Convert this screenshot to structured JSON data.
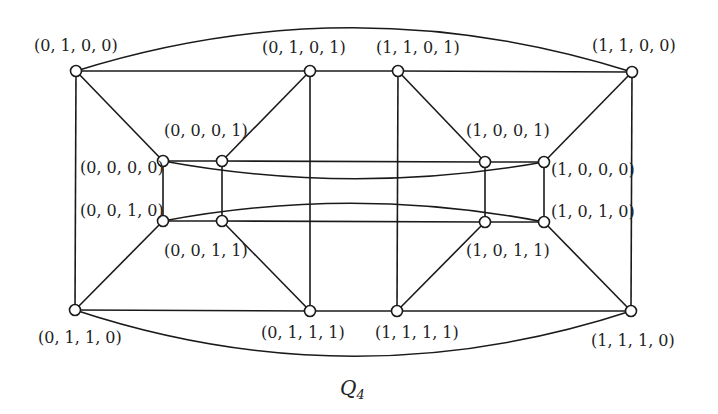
{
  "diagram": {
    "title": "Q",
    "title_subscript": "4",
    "colors": {
      "stroke": "#1a1a1a",
      "node_fill": "#ffffff",
      "text": "#222222",
      "background": "#ffffff"
    },
    "node_radius": 5.5,
    "nodes": [
      {
        "id": "0100",
        "label": "(0, 1, 0, 0)",
        "x": 76,
        "y": 71,
        "lx": 34,
        "ly": 51,
        "anchor": "start"
      },
      {
        "id": "0101",
        "label": "(0, 1, 0, 1)",
        "x": 310,
        "y": 71,
        "lx": 262,
        "ly": 53,
        "anchor": "start"
      },
      {
        "id": "1101",
        "label": "(1, 1, 0, 1)",
        "x": 398,
        "y": 71,
        "lx": 376,
        "ly": 53,
        "anchor": "start"
      },
      {
        "id": "1100",
        "label": "(1, 1, 0, 0)",
        "x": 632,
        "y": 72,
        "lx": 592,
        "ly": 51,
        "anchor": "start"
      },
      {
        "id": "0000",
        "label": "(0, 0, 0, 0)",
        "x": 163,
        "y": 161,
        "lx": 80,
        "ly": 173,
        "anchor": "start"
      },
      {
        "id": "0001",
        "label": "(0, 0, 0, 1)",
        "x": 222,
        "y": 161,
        "lx": 164,
        "ly": 136,
        "anchor": "start"
      },
      {
        "id": "1001",
        "label": "(1, 0, 0, 1)",
        "x": 485,
        "y": 162,
        "lx": 466,
        "ly": 136,
        "anchor": "start"
      },
      {
        "id": "1000",
        "label": "(1, 0, 0, 0)",
        "x": 544,
        "y": 162,
        "lx": 551,
        "ly": 175,
        "anchor": "start"
      },
      {
        "id": "0010",
        "label": "(0, 0, 1, 0)",
        "x": 163,
        "y": 221,
        "lx": 80,
        "ly": 216,
        "anchor": "start"
      },
      {
        "id": "0011",
        "label": "(0, 0, 1, 1)",
        "x": 222,
        "y": 221,
        "lx": 164,
        "ly": 256,
        "anchor": "start"
      },
      {
        "id": "1011",
        "label": "(1, 0, 1, 1)",
        "x": 485,
        "y": 222,
        "lx": 466,
        "ly": 256,
        "anchor": "start"
      },
      {
        "id": "1010",
        "label": "(1, 0, 1, 0)",
        "x": 544,
        "y": 222,
        "lx": 551,
        "ly": 217,
        "anchor": "start"
      },
      {
        "id": "0110",
        "label": "(0, 1, 1, 0)",
        "x": 75,
        "y": 310,
        "lx": 38,
        "ly": 343,
        "anchor": "start"
      },
      {
        "id": "0111",
        "label": "(0, 1, 1, 1)",
        "x": 310,
        "y": 311,
        "lx": 261,
        "ly": 338,
        "anchor": "start"
      },
      {
        "id": "1111",
        "label": "(1, 1, 1, 1)",
        "x": 397,
        "y": 311,
        "lx": 375,
        "ly": 338,
        "anchor": "start"
      },
      {
        "id": "1110",
        "label": "(1, 1, 1, 0)",
        "x": 631,
        "y": 311,
        "lx": 591,
        "ly": 346,
        "anchor": "start"
      }
    ],
    "edges": [
      {
        "from": "0100",
        "to": "0101"
      },
      {
        "from": "0101",
        "to": "1101"
      },
      {
        "from": "1101",
        "to": "1100"
      },
      {
        "from": "0110",
        "to": "0111"
      },
      {
        "from": "0111",
        "to": "1111"
      },
      {
        "from": "1111",
        "to": "1110"
      },
      {
        "from": "0100",
        "to": "0110"
      },
      {
        "from": "1100",
        "to": "1110"
      },
      {
        "from": "0101",
        "to": "0111"
      },
      {
        "from": "1101",
        "to": "1111"
      },
      {
        "from": "0100",
        "to": "0000"
      },
      {
        "from": "0101",
        "to": "0001"
      },
      {
        "from": "1101",
        "to": "1001"
      },
      {
        "from": "1100",
        "to": "1000"
      },
      {
        "from": "0110",
        "to": "0010"
      },
      {
        "from": "0111",
        "to": "0011"
      },
      {
        "from": "1111",
        "to": "1011"
      },
      {
        "from": "1110",
        "to": "1010"
      },
      {
        "from": "0000",
        "to": "0001"
      },
      {
        "from": "0001",
        "to": "1001"
      },
      {
        "from": "1001",
        "to": "1000"
      },
      {
        "from": "0010",
        "to": "0011"
      },
      {
        "from": "0011",
        "to": "1011"
      },
      {
        "from": "1011",
        "to": "1010"
      },
      {
        "from": "0000",
        "to": "0010"
      },
      {
        "from": "0001",
        "to": "0011"
      },
      {
        "from": "1001",
        "to": "1011"
      },
      {
        "from": "1000",
        "to": "1010"
      },
      {
        "from": "0100",
        "to": "1100",
        "curve": {
          "cx": 354,
          "cy": -16
        }
      },
      {
        "from": "0110",
        "to": "1110",
        "curve": {
          "cx": 353,
          "cy": 402
        }
      },
      {
        "from": "0000",
        "to": "1000",
        "curve": {
          "cx": 353,
          "cy": 196
        }
      },
      {
        "from": "0010",
        "to": "1010",
        "curve": {
          "cx": 353,
          "cy": 185
        }
      }
    ]
  }
}
